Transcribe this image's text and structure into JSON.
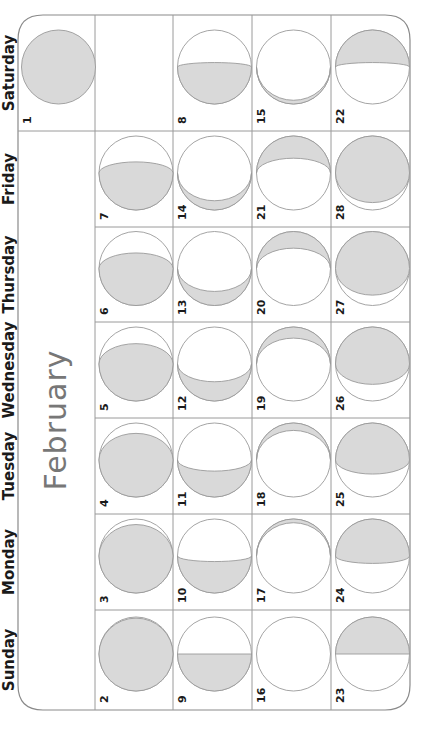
{
  "calendar": {
    "month": "February",
    "weekdays": [
      "Saturday",
      "Friday",
      "Thursday",
      "Wednesday",
      "Tuesday",
      "Monday",
      "Sunday"
    ],
    "orientation": "rotated-90-ccw",
    "colors": {
      "shade": "#d9d9d9",
      "line": "#9a9a9a",
      "month_text": "#777777",
      "text": "#1a1a1a"
    },
    "days": [
      {
        "date": "1",
        "col": 0,
        "row": 0,
        "shade": "full"
      },
      {
        "date": "2",
        "col": 1,
        "row": 6,
        "shade": "bottom",
        "t": -0.97
      },
      {
        "date": "3",
        "col": 1,
        "row": 5,
        "shade": "bottom",
        "t": -0.85
      },
      {
        "date": "4",
        "col": 1,
        "row": 4,
        "shade": "bottom",
        "t": -0.72
      },
      {
        "date": "5",
        "col": 1,
        "row": 3,
        "shade": "bottom",
        "t": -0.55
      },
      {
        "date": "6",
        "col": 1,
        "row": 2,
        "shade": "bottom",
        "t": -0.42
      },
      {
        "date": "7",
        "col": 1,
        "row": 1,
        "shade": "bottom",
        "t": -0.3
      },
      {
        "date": "8",
        "col": 2,
        "row": 0,
        "shade": "bottom",
        "t": -0.12
      },
      {
        "date": "9",
        "col": 2,
        "row": 6,
        "shade": "bottom",
        "t": 0.0
      },
      {
        "date": "10",
        "col": 2,
        "row": 5,
        "shade": "bottom",
        "t": 0.15
      },
      {
        "date": "11",
        "col": 2,
        "row": 4,
        "shade": "bottom",
        "t": 0.3
      },
      {
        "date": "12",
        "col": 2,
        "row": 3,
        "shade": "bottom",
        "t": 0.48
      },
      {
        "date": "13",
        "col": 2,
        "row": 2,
        "shade": "bottom",
        "t": 0.62
      },
      {
        "date": "14",
        "col": 2,
        "row": 1,
        "shade": "bottom",
        "t": 0.75
      },
      {
        "date": "15",
        "col": 3,
        "row": 0,
        "shade": "bottom",
        "t": 0.9
      },
      {
        "date": "16",
        "col": 3,
        "row": 6,
        "shade": "none"
      },
      {
        "date": "17",
        "col": 3,
        "row": 5,
        "shade": "top",
        "t": 0.9
      },
      {
        "date": "18",
        "col": 3,
        "row": 4,
        "shade": "top",
        "t": 0.8
      },
      {
        "date": "19",
        "col": 3,
        "row": 3,
        "shade": "top",
        "t": 0.7
      },
      {
        "date": "20",
        "col": 3,
        "row": 2,
        "shade": "top",
        "t": 0.55
      },
      {
        "date": "21",
        "col": 3,
        "row": 1,
        "shade": "top",
        "t": 0.4
      },
      {
        "date": "22",
        "col": 4,
        "row": 0,
        "shade": "top",
        "t": 0.12
      },
      {
        "date": "23",
        "col": 4,
        "row": 6,
        "shade": "top",
        "t": 0.0
      },
      {
        "date": "24",
        "col": 4,
        "row": 5,
        "shade": "top",
        "t": -0.2
      },
      {
        "date": "25",
        "col": 4,
        "row": 4,
        "shade": "top",
        "t": -0.38
      },
      {
        "date": "26",
        "col": 4,
        "row": 3,
        "shade": "top",
        "t": -0.55
      },
      {
        "date": "27",
        "col": 4,
        "row": 2,
        "shade": "top",
        "t": -0.72
      },
      {
        "date": "28",
        "col": 4,
        "row": 1,
        "shade": "top",
        "t": -0.8
      }
    ]
  }
}
